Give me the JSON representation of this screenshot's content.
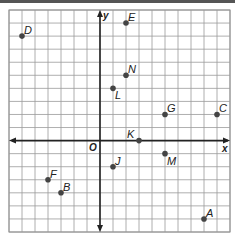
{
  "chart_data": {
    "type": "scatter",
    "title": "",
    "xlabel": "x",
    "ylabel": "y",
    "origin_label": "O",
    "xlim": [
      -7,
      10
    ],
    "ylim": [
      -7,
      10
    ],
    "grid": true,
    "grid_step": 1,
    "points": [
      {
        "label": "A",
        "x": 8,
        "y": -6
      },
      {
        "label": "B",
        "x": -3,
        "y": -4
      },
      {
        "label": "C",
        "x": 9,
        "y": 2
      },
      {
        "label": "D",
        "x": -6,
        "y": 8
      },
      {
        "label": "E",
        "x": 2,
        "y": 9
      },
      {
        "label": "F",
        "x": -4,
        "y": -3
      },
      {
        "label": "G",
        "x": 5,
        "y": 2
      },
      {
        "label": "J",
        "x": 1,
        "y": -2
      },
      {
        "label": "K",
        "x": 3,
        "y": 0
      },
      {
        "label": "L",
        "x": 1,
        "y": 4
      },
      {
        "label": "M",
        "x": 5,
        "y": -1
      },
      {
        "label": "N",
        "x": 2,
        "y": 5
      }
    ],
    "colors": {
      "grid": "#9a9a9a",
      "axis": "#222222",
      "point": "#444444",
      "border": "#888888"
    }
  }
}
